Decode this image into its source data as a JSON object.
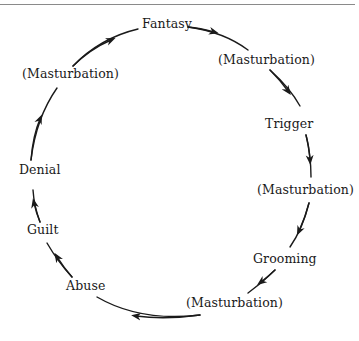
{
  "diagram": {
    "type": "cycle",
    "direction": "clockwise",
    "nodes": [
      {
        "id": "fantasy",
        "label": "Fantasy",
        "x": 142,
        "y": 17
      },
      {
        "id": "masturbation-1",
        "label": "(Masturbation)",
        "x": 218,
        "y": 53
      },
      {
        "id": "trigger",
        "label": "Trigger",
        "x": 265,
        "y": 117
      },
      {
        "id": "masturbation-2",
        "label": "(Masturbation)",
        "x": 257,
        "y": 183
      },
      {
        "id": "grooming",
        "label": "Grooming",
        "x": 253,
        "y": 252
      },
      {
        "id": "masturbation-3",
        "label": "(Masturbation)",
        "x": 186,
        "y": 296
      },
      {
        "id": "abuse",
        "label": "Abuse",
        "x": 66,
        "y": 279
      },
      {
        "id": "guilt",
        "label": "Guilt",
        "x": 27,
        "y": 223
      },
      {
        "id": "denial",
        "label": "Denial",
        "x": 19,
        "y": 163
      },
      {
        "id": "masturbation-4",
        "label": "(Masturbation)",
        "x": 22,
        "y": 67
      }
    ],
    "edges": [
      {
        "from": "fantasy",
        "to": "masturbation-1"
      },
      {
        "from": "masturbation-1",
        "to": "trigger"
      },
      {
        "from": "trigger",
        "to": "masturbation-2"
      },
      {
        "from": "masturbation-2",
        "to": "grooming"
      },
      {
        "from": "grooming",
        "to": "masturbation-3"
      },
      {
        "from": "masturbation-3",
        "to": "abuse"
      },
      {
        "from": "abuse",
        "to": "guilt"
      },
      {
        "from": "guilt",
        "to": "denial"
      },
      {
        "from": "denial",
        "to": "masturbation-4"
      },
      {
        "from": "masturbation-4",
        "to": "fantasy"
      }
    ]
  },
  "colors": {
    "line": "#1a1a1a",
    "text": "#1a1a1a",
    "rule": "#8a8a8a"
  }
}
